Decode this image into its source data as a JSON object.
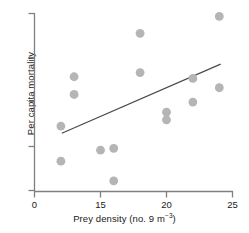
{
  "chart_data": {
    "type": "scatter",
    "title": "",
    "xlabel": "Prey density (no. 9 m−3)",
    "ylabel": "Per capita mortality",
    "xlabel_parts": {
      "base": "Prey density (no. 9 m",
      "exponent": "−3",
      "tail": ")"
    },
    "grid": false,
    "legend": null,
    "xlim": [
      0,
      25
    ],
    "x_axis_broken": true,
    "x_break_note": "axis compressed between 0 and 15",
    "xticks": [
      0,
      15,
      20,
      25
    ],
    "xticklabels": [
      "0",
      "15",
      "20",
      "25"
    ],
    "yticks": [
      0,
      1,
      2,
      3,
      4
    ],
    "yticklabels": [
      "",
      "",
      "",
      "",
      ""
    ],
    "ylim": [
      0,
      4.35
    ],
    "marker_color": "#b5b5b5",
    "line_color": "#4a4a4a",
    "axis_color": "#808080",
    "points": [
      {
        "x": 6,
        "y": 1.55
      },
      {
        "x": 6,
        "y": 0.72
      },
      {
        "x": 9,
        "y": 2.72
      },
      {
        "x": 9,
        "y": 2.3
      },
      {
        "x": 15,
        "y": 0.98
      },
      {
        "x": 16,
        "y": 1.02
      },
      {
        "x": 16,
        "y": 0.25
      },
      {
        "x": 18,
        "y": 3.75
      },
      {
        "x": 18,
        "y": 2.82
      },
      {
        "x": 20,
        "y": 1.88
      },
      {
        "x": 20,
        "y": 1.7
      },
      {
        "x": 22,
        "y": 2.68
      },
      {
        "x": 22,
        "y": 2.12
      },
      {
        "x": 24,
        "y": 4.15
      },
      {
        "x": 24,
        "y": 2.46
      }
    ],
    "regression_line": {
      "x_start": 6.2,
      "y_start": 1.38,
      "x_end": 24.1,
      "y_end": 3.02
    }
  }
}
